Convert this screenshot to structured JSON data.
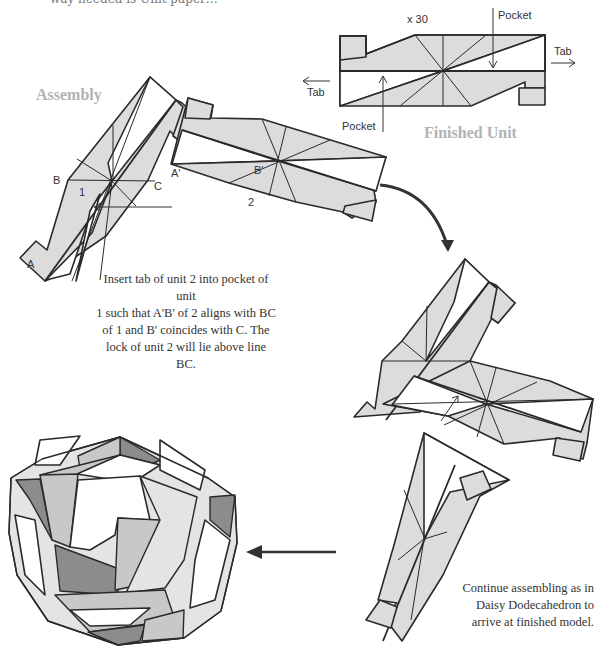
{
  "top_fragment": "way needed is Unit paper…",
  "finished_unit": {
    "heading": "Finished Unit",
    "count_label": "x 30",
    "labels": {
      "pocket_top": "Pocket",
      "pocket_bottom": "Pocket",
      "tab_right": "Tab",
      "tab_left": "Tab"
    }
  },
  "assembly": {
    "heading": "Assembly",
    "unit1_points": {
      "A": "A",
      "B": "B",
      "C": "C",
      "number": "1"
    },
    "unit2_points": {
      "A_prime": "A'",
      "B_prime": "B'",
      "number": "2"
    },
    "instruction_lines": [
      "Insert tab of unit 2 into pocket of unit",
      "1 such that A'B' of 2 aligns with BC",
      "of 1 and B' coincides with C. The",
      "lock of unit 2 will lie above line BC."
    ]
  },
  "continue_note": {
    "lines": [
      "Continue assembling as in",
      "Daisy Dodecahedron to",
      "arrive at finished model."
    ]
  },
  "colors": {
    "paper_fill": "#dcdcdc",
    "dark_fill": "#8c8c8c",
    "outline": "#2a2a2a",
    "heading_gray": "#b3b3b3",
    "text": "#333333"
  }
}
